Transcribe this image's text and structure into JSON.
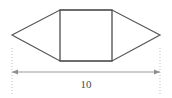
{
  "figure": {
    "canvas": {
      "width": 172,
      "height": 98,
      "background": "#ffffff"
    },
    "colors": {
      "outline": "#555555",
      "rectangle_edge": "#4d4d4d",
      "dimension_line": "#9a9a9a",
      "extension_line": "#bdbdbd",
      "label_text": "#4a4a4a"
    },
    "shape": {
      "name": "hexagon",
      "description": "rectangle flanked by two triangles",
      "vertices": [
        {
          "name": "left-apex",
          "x": 12,
          "y": 35
        },
        {
          "name": "rect-top-left",
          "x": 60,
          "y": 10
        },
        {
          "name": "rect-top-right",
          "x": 112,
          "y": 10
        },
        {
          "name": "right-apex",
          "x": 160,
          "y": 35
        },
        {
          "name": "rect-bottom-right",
          "x": 112,
          "y": 61
        },
        {
          "name": "rect-bottom-left",
          "x": 60,
          "y": 61
        }
      ],
      "rectangle": {
        "x1": 60,
        "y1": 10,
        "x2": 112,
        "y2": 61
      },
      "stroke_width": 1.2,
      "fill": "none"
    },
    "dimension": {
      "label": "10",
      "label_x": 86,
      "label_y": 85,
      "line_y": 72,
      "x_start": 12,
      "x_end": 160,
      "arrow_size": 4,
      "extension_lines": [
        {
          "name": "left-extension",
          "x": 12,
          "y_top": 48,
          "y_bottom": 94
        },
        {
          "name": "right-extension",
          "x": 160,
          "y_top": 48,
          "y_bottom": 94
        }
      ],
      "dash_pattern": "1,2"
    }
  }
}
